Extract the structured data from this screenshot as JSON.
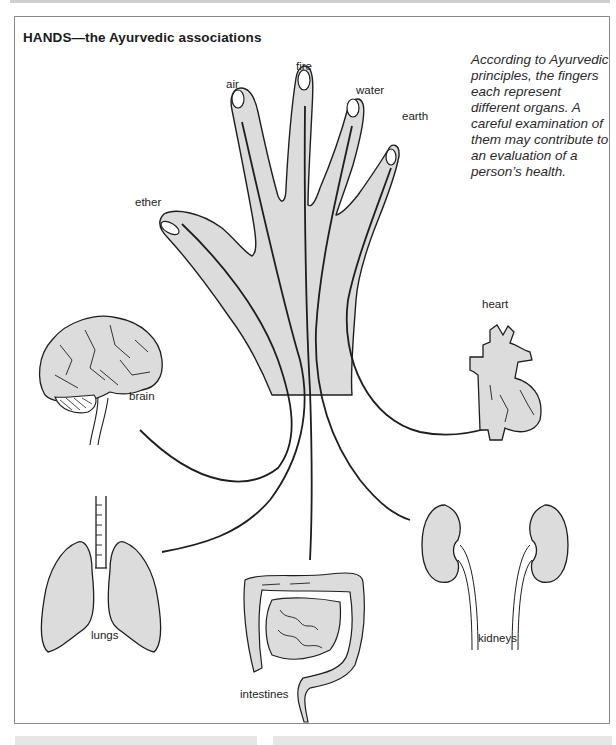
{
  "figure": {
    "title": "HANDS—the Ayurvedic associations",
    "caption": "According to Ayurvedic principles, the fingers each represent different organs. A careful examination of them may contribute to an evaluation of a person’s health.",
    "colors": {
      "fill": "#dcdcdc",
      "outline": "#1e1e1e",
      "frame": "#8a8a8a",
      "page_bar": "#e6e6e6"
    },
    "fingers": [
      {
        "name": "thumb",
        "element": "ether",
        "organ": "brain"
      },
      {
        "name": "index",
        "element": "air",
        "organ": "lungs"
      },
      {
        "name": "middle",
        "element": "fire",
        "organ": "intestines"
      },
      {
        "name": "ring",
        "element": "water",
        "organ": "kidneys"
      },
      {
        "name": "little",
        "element": "earth",
        "organ": "heart"
      }
    ],
    "labels": {
      "ether": "ether",
      "air": "air",
      "fire": "fire",
      "water": "water",
      "earth": "earth",
      "brain": "brain",
      "heart": "heart",
      "lungs": "lungs",
      "intestines": "intestines",
      "kidneys": "kidneys"
    }
  }
}
